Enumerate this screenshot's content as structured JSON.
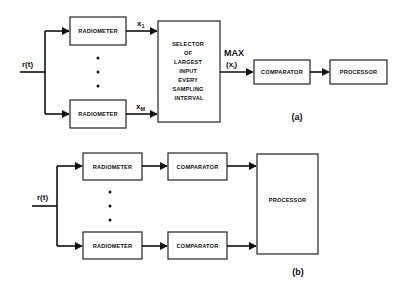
{
  "diagram_a": {
    "caption": "(a)",
    "input_label": "r(t)",
    "radiometer_top_label": "RADIOMETER",
    "radiometer_bottom_label": "RADIOMETER",
    "signal_top": "x",
    "signal_top_sub": "1",
    "signal_bottom": "x",
    "signal_bottom_sub": "M",
    "selector_lines": [
      "SELECTOR",
      "OF",
      "LARGEST",
      "INPUT",
      "EVERY",
      "SAMPLING",
      "INTERVAL"
    ],
    "max_label": "MAX",
    "max_arg": "(x",
    "max_arg_sub": "i",
    "max_arg_close": ")",
    "comparator_label": "COMPARATOR",
    "processor_label": "PROCESSOR"
  },
  "diagram_b": {
    "caption": "(b)",
    "input_label": "r(t)",
    "radiometer_top_label": "RADIOMETER",
    "radiometer_bottom_label": "RADIOMETER",
    "comparator_top_label": "COMPARATOR",
    "comparator_bottom_label": "COMPARATOR",
    "processor_label": "PROCESSOR"
  },
  "colors": {
    "line": "#111111",
    "background": "#ffffff"
  }
}
